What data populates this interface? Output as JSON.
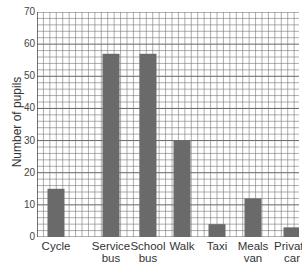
{
  "chart_data": {
    "type": "bar",
    "title": "",
    "xlabel": "",
    "ylabel": "Number of pupils",
    "ylim": [
      0,
      70
    ],
    "yticks": [
      0,
      10,
      20,
      30,
      40,
      50,
      60,
      70
    ],
    "grid": true,
    "grid_minor_step": 2,
    "categories": [
      "Cycle",
      "Service bus",
      "School bus",
      "Walk",
      "Taxi",
      "Meals van",
      "Private car"
    ],
    "category_lines": [
      [
        "Cycle",
        ""
      ],
      [
        "Service",
        "bus"
      ],
      [
        "School",
        "bus"
      ],
      [
        "Walk",
        ""
      ],
      [
        "Taxi",
        ""
      ],
      [
        "Meals",
        "van"
      ],
      [
        "Private",
        "car"
      ]
    ],
    "values": [
      15,
      57,
      57,
      30,
      4,
      12,
      3
    ],
    "bar_color": "#6a6a6a"
  }
}
